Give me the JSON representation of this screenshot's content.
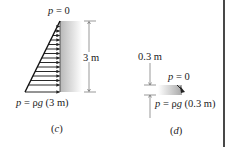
{
  "panel_c": {
    "top_label_var": "p",
    "top_label_rest": " = 0",
    "bottom_label_var": "p",
    "bottom_label_mid": " = ρ",
    "bottom_label_g": "g",
    "bottom_label_rest": " (3 m)",
    "dimension": "3 m",
    "caption_open": "(",
    "caption_letter": "c",
    "caption_close": ")"
  },
  "panel_d": {
    "dimension": "0.3 m",
    "top_label_var": "p",
    "top_label_rest": " = 0",
    "bottom_label_var": "p",
    "bottom_label_mid": " = ρ",
    "bottom_label_g": "g",
    "bottom_label_rest": " (0.3 m)",
    "caption_open": "(",
    "caption_letter": "d",
    "caption_close": ")"
  },
  "colors": {
    "ink": "#222222",
    "wall_shade_start": "#b8b8b8",
    "wall_shade_end": "#ffffff",
    "border": "#1a1a1a"
  }
}
